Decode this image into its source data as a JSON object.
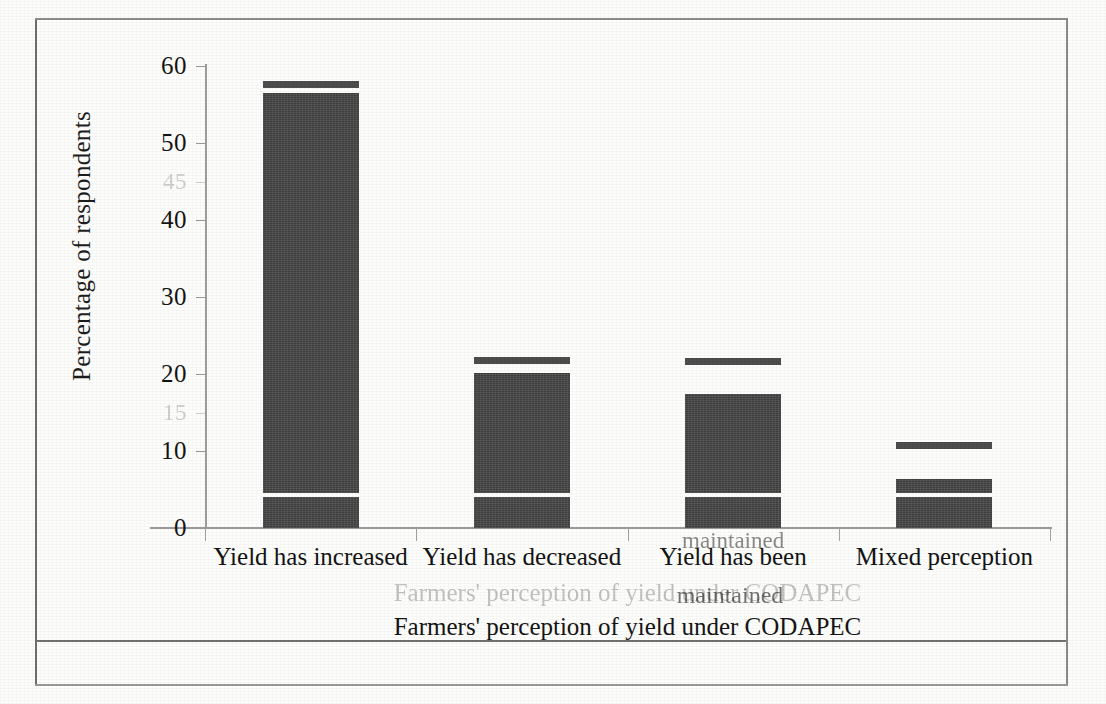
{
  "document": {
    "type": "scanned-figure",
    "background_color": "#fdfdfc",
    "ink_color": "#484848"
  },
  "chart_data": {
    "type": "bar",
    "title": "",
    "xlabel": "Farmers' perception of yield under CODAPEC",
    "ylabel": "Percentage of respondents",
    "categories": [
      "Yield has increased",
      "Yield has decreased",
      "Yield has been maintained",
      "Mixed perception"
    ],
    "category_lines": [
      [
        "Yield has increased"
      ],
      [
        "Yield has decreased"
      ],
      [
        "Yield has been",
        "maintained"
      ],
      [
        "Mixed perception"
      ]
    ],
    "values": [
      58,
      22,
      22,
      11
    ],
    "series": [
      {
        "name": "Percentage of respondents",
        "values": [
          58,
          22,
          22,
          11
        ]
      }
    ],
    "ylim": [
      0,
      60
    ],
    "yticks": [
      0,
      10,
      20,
      30,
      40,
      50,
      60
    ],
    "ytick_labels": [
      "0",
      "10",
      "20",
      "30",
      "40",
      "50",
      "60"
    ],
    "grid": false,
    "legend": "none"
  },
  "y_axis": {
    "title": "Percentage of respondents",
    "ticks": [
      {
        "label": "60",
        "value": 60,
        "ghost": false
      },
      {
        "label": "50",
        "value": 50,
        "ghost": false
      },
      {
        "label": "45",
        "value": 45,
        "ghost": true
      },
      {
        "label": "40",
        "value": 40,
        "ghost": false
      },
      {
        "label": "30",
        "value": 30,
        "ghost": false
      },
      {
        "label": "20",
        "value": 20,
        "ghost": false
      },
      {
        "label": "15",
        "value": 15,
        "ghost": true
      },
      {
        "label": "10",
        "value": 10,
        "ghost": false
      },
      {
        "label": "0",
        "value": 0,
        "ghost": false
      }
    ]
  },
  "x_axis": {
    "title": "Farmers' perception of yield under CODAPEC",
    "ghost_title": "Farmers' perception of yield under CODAPEC",
    "ghost_fragment": "maintained",
    "categories": [
      {
        "line1": "Yield has increased",
        "line2": ""
      },
      {
        "line1": "Yield has decreased",
        "line2": ""
      },
      {
        "line1": "Yield has been",
        "line2": "maintained"
      },
      {
        "line1": "Mixed perception",
        "line2": ""
      }
    ]
  },
  "bars": [
    {
      "name": "yield-has-increased",
      "total": 58,
      "segments": [
        {
          "kind": "cap",
          "top": 58.0,
          "bottom": 57.2
        },
        {
          "kind": "body",
          "top": 56.5,
          "bottom": 4.6
        },
        {
          "kind": "base",
          "top": 4.0,
          "bottom": 0.0
        }
      ]
    },
    {
      "name": "yield-has-decreased",
      "total": 22,
      "segments": [
        {
          "kind": "cap",
          "top": 22.2,
          "bottom": 21.3
        },
        {
          "kind": "body",
          "top": 20.1,
          "bottom": 4.6
        },
        {
          "kind": "base",
          "top": 4.0,
          "bottom": 0.0
        }
      ]
    },
    {
      "name": "yield-has-been-maintained",
      "total": 22,
      "segments": [
        {
          "kind": "cap",
          "top": 22.1,
          "bottom": 21.2
        },
        {
          "kind": "body",
          "top": 17.4,
          "bottom": 4.6
        },
        {
          "kind": "base",
          "top": 4.0,
          "bottom": 0.0
        }
      ]
    },
    {
      "name": "mixed-perception",
      "total": 11,
      "segments": [
        {
          "kind": "cap",
          "top": 11.2,
          "bottom": 10.2
        },
        {
          "kind": "body",
          "top": 6.3,
          "bottom": 4.6
        },
        {
          "kind": "base",
          "top": 4.0,
          "bottom": 0.0
        }
      ]
    }
  ]
}
